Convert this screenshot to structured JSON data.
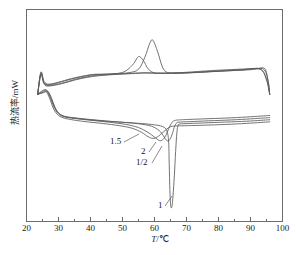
{
  "chart_data": {
    "type": "line",
    "title": "",
    "xlabel": "T/°C",
    "ylabel": "热流率/mW",
    "xlim": [
      20,
      100
    ],
    "ylim": [
      0,
      1
    ],
    "grid": false,
    "legend_position": "inline-annotations",
    "xticks": [
      "20",
      "30",
      "40",
      "50",
      "60",
      "70",
      "80",
      "90",
      "100"
    ],
    "xtick_values": [
      20,
      30,
      40,
      50,
      60,
      70,
      80,
      90,
      100
    ],
    "yticks": [],
    "minor_ticks_per_interval": 1,
    "axis_color": "#6b6b6b",
    "line_color": "#5a5a5a",
    "annotations": [
      {
        "label": "1.5",
        "x_pos": 52.0,
        "y_note": "points to lower-branch shoulder near 57 °C"
      },
      {
        "label": "2",
        "x_pos": 55.5,
        "y_note": "points to lower-branch trough near 61 °C"
      },
      {
        "label": "1/2",
        "x_pos": 55.0,
        "y_note": "points to lower-branch trough near 63 °C"
      },
      {
        "label": "1",
        "x_pos": 63.5,
        "y_note": "points to deep sharp endotherm near 66 °C"
      }
    ],
    "series": [
      {
        "name": "1.5",
        "branch": "upper-heating",
        "x": [
          23.5,
          24.5,
          25.5,
          27,
          30,
          34,
          38,
          41,
          44,
          48,
          51,
          53.5,
          55,
          56.5,
          58,
          60,
          62,
          65,
          70,
          78,
          86,
          92,
          94.5,
          95.5,
          96
        ],
        "y": [
          0.6,
          0.7,
          0.655,
          0.645,
          0.655,
          0.672,
          0.685,
          0.692,
          0.694,
          0.697,
          0.71,
          0.745,
          0.778,
          0.76,
          0.72,
          0.7,
          0.699,
          0.7,
          0.704,
          0.712,
          0.718,
          0.722,
          0.72,
          0.66,
          0.6
        ]
      },
      {
        "name": "2",
        "branch": "upper-heating",
        "x": [
          23.5,
          24.5,
          25.5,
          27,
          30,
          34,
          38,
          41,
          44,
          48,
          52,
          55,
          57,
          58.5,
          59.5,
          61,
          62.5,
          64,
          67,
          72,
          80,
          88,
          93,
          95,
          96
        ],
        "y": [
          0.6,
          0.705,
          0.66,
          0.648,
          0.657,
          0.674,
          0.687,
          0.694,
          0.695,
          0.698,
          0.702,
          0.718,
          0.775,
          0.84,
          0.855,
          0.8,
          0.728,
          0.703,
          0.7,
          0.703,
          0.71,
          0.717,
          0.72,
          0.672,
          0.6
        ]
      },
      {
        "name": "1/2",
        "branch": "upper-heating",
        "x": [
          23.5,
          24.5,
          25.5,
          27,
          31,
          35,
          39,
          42,
          46,
          50,
          54,
          57,
          59,
          61,
          63,
          66,
          71,
          79,
          87,
          93,
          95,
          96
        ],
        "y": [
          0.6,
          0.698,
          0.652,
          0.642,
          0.652,
          0.67,
          0.683,
          0.69,
          0.694,
          0.697,
          0.7,
          0.702,
          0.701,
          0.7,
          0.699,
          0.699,
          0.701,
          0.708,
          0.714,
          0.718,
          0.668,
          0.6
        ]
      },
      {
        "name": "1",
        "branch": "upper-heating",
        "x": [
          23.5,
          24.5,
          25.5,
          27,
          31,
          35,
          39,
          43,
          47,
          51,
          55,
          58,
          61,
          64,
          68,
          74,
          82,
          90,
          94,
          95.5,
          96
        ],
        "y": [
          0.6,
          0.692,
          0.648,
          0.639,
          0.65,
          0.667,
          0.68,
          0.688,
          0.693,
          0.696,
          0.699,
          0.7,
          0.7,
          0.7,
          0.701,
          0.704,
          0.71,
          0.716,
          0.719,
          0.665,
          0.6
        ]
      },
      {
        "name": "1.5",
        "branch": "lower-cooling",
        "x": [
          96,
          94,
          90,
          84,
          77,
          70,
          67,
          66,
          65.5,
          64.5,
          63,
          61,
          59.5,
          58,
          56,
          53,
          49,
          44,
          39,
          35,
          32,
          30,
          28.5,
          27.5,
          26.5,
          25.5,
          24.5,
          23.5
        ],
        "y": [
          0.47,
          0.468,
          0.464,
          0.459,
          0.455,
          0.452,
          0.451,
          0.45,
          0.449,
          0.444,
          0.425,
          0.4,
          0.392,
          0.4,
          0.42,
          0.44,
          0.452,
          0.462,
          0.47,
          0.478,
          0.487,
          0.5,
          0.53,
          0.57,
          0.605,
          0.62,
          0.612,
          0.6
        ]
      },
      {
        "name": "2",
        "branch": "lower-cooling",
        "x": [
          96,
          94,
          90,
          84,
          77,
          70,
          67.5,
          66.5,
          65.5,
          64.5,
          63.5,
          62.5,
          61.5,
          60,
          58,
          55,
          51,
          46,
          41,
          36,
          32.5,
          30.5,
          29,
          28,
          27,
          26,
          25,
          23.5
        ],
        "y": [
          0.5,
          0.498,
          0.494,
          0.489,
          0.485,
          0.481,
          0.479,
          0.477,
          0.468,
          0.44,
          0.405,
          0.385,
          0.382,
          0.398,
          0.42,
          0.443,
          0.458,
          0.468,
          0.476,
          0.484,
          0.492,
          0.505,
          0.535,
          0.575,
          0.608,
          0.622,
          0.613,
          0.6
        ]
      },
      {
        "name": "1/2",
        "branch": "lower-cooling",
        "x": [
          96,
          94,
          90,
          84,
          77,
          71,
          68,
          67,
          66.3,
          65.6,
          65,
          64.3,
          63.6,
          62.8,
          61.5,
          59,
          55,
          50,
          45,
          40,
          35,
          31.5,
          29.5,
          28.3,
          27.2,
          26.2,
          25.2,
          23.5
        ],
        "y": [
          0.49,
          0.488,
          0.484,
          0.479,
          0.475,
          0.471,
          0.469,
          0.466,
          0.45,
          0.415,
          0.392,
          0.38,
          0.385,
          0.404,
          0.428,
          0.45,
          0.461,
          0.468,
          0.474,
          0.481,
          0.489,
          0.498,
          0.52,
          0.558,
          0.598,
          0.618,
          0.61,
          0.6
        ]
      },
      {
        "name": "1",
        "branch": "lower-cooling",
        "x": [
          96,
          94,
          90,
          84,
          77,
          72,
          69,
          68,
          67.4,
          67.0,
          66.6,
          66.2,
          65.8,
          65.5,
          65.2,
          65.0,
          64.8,
          64.6,
          64.4,
          63.8,
          62.5,
          60,
          56,
          51,
          46,
          41,
          36,
          32,
          30,
          28.6,
          27.4,
          26.4,
          25.4,
          23.5
        ],
        "y": [
          0.48,
          0.478,
          0.474,
          0.47,
          0.466,
          0.463,
          0.461,
          0.46,
          0.455,
          0.42,
          0.33,
          0.215,
          0.125,
          0.075,
          0.065,
          0.085,
          0.15,
          0.27,
          0.38,
          0.43,
          0.448,
          0.456,
          0.462,
          0.467,
          0.472,
          0.478,
          0.486,
          0.494,
          0.508,
          0.54,
          0.585,
          0.612,
          0.608,
          0.6
        ]
      }
    ]
  }
}
